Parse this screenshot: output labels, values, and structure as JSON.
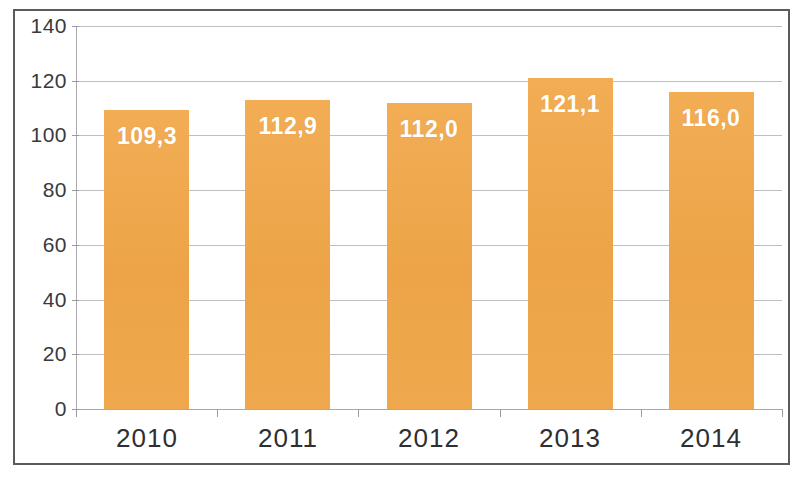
{
  "chart_data": {
    "type": "bar",
    "title": "",
    "subtitle": "",
    "xlabel": "",
    "ylabel": "",
    "categories": [
      "2010",
      "2011",
      "2012",
      "2013",
      "2014"
    ],
    "values": [
      109.3,
      112.9,
      112.0,
      121.1,
      116.0
    ],
    "value_labels": [
      "109,3",
      "112,9",
      "112,0",
      "121,1",
      "116,0"
    ],
    "series": [
      {
        "name": "",
        "values": [
          109.3,
          112.9,
          112.0,
          121.1,
          116.0
        ]
      }
    ],
    "ylim": [
      0,
      140
    ],
    "ytick_step": 20,
    "ytick_labels": [
      "0",
      "20",
      "40",
      "60",
      "80",
      "100",
      "120",
      "140"
    ],
    "ytick_values": [
      0,
      20,
      40,
      60,
      80,
      100,
      120,
      140
    ],
    "grid": true,
    "grid_axis": "y",
    "legend": false,
    "legend_position": "none",
    "decimal_separator": ",",
    "bar_color": "#f0a94e",
    "label_color": "#ffffff",
    "gridline_color": "#bfbfc2",
    "axis_color": "#a9a9ad",
    "frame_color": "#5b5b5f",
    "background_color": "#ffffff"
  }
}
